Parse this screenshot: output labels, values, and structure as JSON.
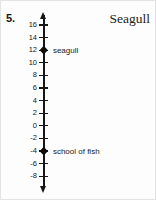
{
  "problem": {
    "number": "5."
  },
  "header": {
    "title": "Seagull"
  },
  "chart_data": {
    "type": "number_line",
    "orientation": "vertical",
    "title": "Seagull",
    "axis_range": [
      -8,
      16
    ],
    "tick_step": 2,
    "tick_labels": [
      16,
      14,
      12,
      10,
      8,
      6,
      4,
      2,
      0,
      -2,
      -4,
      -6,
      -8
    ],
    "arrows": "both",
    "grid": false,
    "points": [
      {
        "value": 12,
        "label": "seagull"
      },
      {
        "value": -4,
        "label": "school of fish"
      }
    ]
  },
  "colors": {
    "axis": "#161616",
    "text": "#1a1a1a"
  }
}
